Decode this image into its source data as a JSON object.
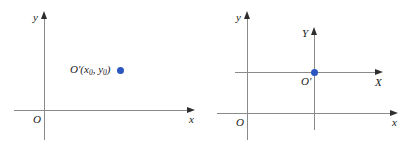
{
  "figure": {
    "background_color": "#ffffff",
    "axis_color": "#8a8a8a",
    "arrow_color": "#2e2e2e",
    "point_color": "#2b56c0",
    "label_color": "#1a1a1a"
  },
  "panels": [
    {
      "id": "left",
      "axes": {
        "x_label": "x",
        "y_label": "y",
        "origin_label": "O"
      },
      "point": {
        "label": "O′(x",
        "label_sub1": "0",
        "label_mid": ", y",
        "label_sub2": "0",
        "label_end": ")",
        "full_label": "O′(x0, y0)",
        "color": "#2b56c0"
      }
    },
    {
      "id": "right",
      "axes": {
        "x_label": "x",
        "y_label": "y",
        "origin_label": "O",
        "translated_x_label": "X",
        "translated_y_label": "Y",
        "translated_origin_label": "O′"
      },
      "point": {
        "color": "#2b56c0"
      }
    }
  ]
}
